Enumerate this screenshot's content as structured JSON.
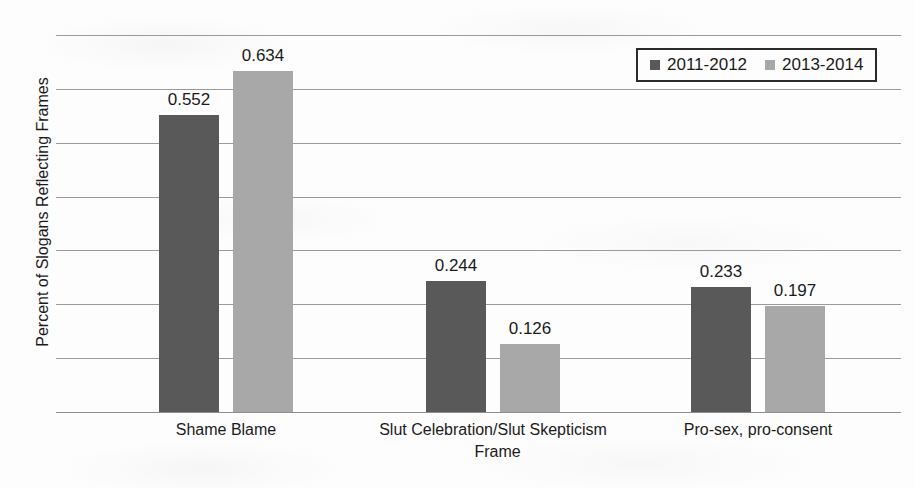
{
  "chart_data": {
    "type": "bar",
    "title": "",
    "xlabel": "Frame",
    "ylabel": "Percent of Slogans Reflecting Frames",
    "categories": [
      "Shame Blame",
      "Slut Celebration/Slut Skepticism",
      "Pro-sex, pro-consent"
    ],
    "series": [
      {
        "name": "2011-2012",
        "color": "#595959",
        "values": [
          0.552,
          0.244,
          0.233
        ]
      },
      {
        "name": "2013-2014",
        "color": "#a8a8a8",
        "values": [
          0.634,
          0.126,
          0.197
        ]
      }
    ],
    "ylim": [
      0,
      0.7
    ],
    "yticks": [
      "0",
      "0.1",
      "0.2",
      "0.3",
      "0.4",
      "0.5",
      "0.6",
      "0.7"
    ],
    "ytick_values": [
      0,
      0.1,
      0.2,
      0.3,
      0.4,
      0.5,
      0.6,
      0.7
    ],
    "data_labels": [
      [
        "0.552",
        "0.634"
      ],
      [
        "0.244",
        "0.126"
      ],
      [
        "0.233",
        "0.197"
      ]
    ],
    "grid": true,
    "legend_position": "top-right"
  },
  "legend": {
    "entries": [
      {
        "label": "2011-2012",
        "swatch": "legend-swatch-dark"
      },
      {
        "label": "2013-2014",
        "swatch": "legend-swatch-light"
      }
    ]
  },
  "axes": {
    "y_title": "Percent of Slogans Reflecting Frames",
    "x_title": "Frame"
  }
}
